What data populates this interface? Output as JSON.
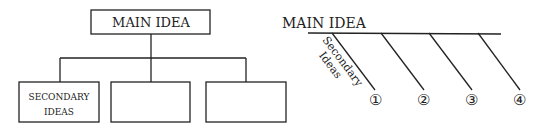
{
  "hierarchy_diagram": {
    "main_label": "MAIN IDEA",
    "children": [
      {
        "line1": "SECONDARY",
        "line2": "IDEAS"
      },
      {
        "line1": "",
        "line2": ""
      },
      {
        "line1": "",
        "line2": ""
      }
    ]
  },
  "spider_diagram": {
    "main_label": "MAIN IDEA",
    "branch_label_line1": "Secondary",
    "branch_label_line2": "Ideas",
    "numbers": [
      "①",
      "②",
      "③",
      "④"
    ]
  },
  "colors": {
    "line": "#222222",
    "background": "#ffffff"
  }
}
